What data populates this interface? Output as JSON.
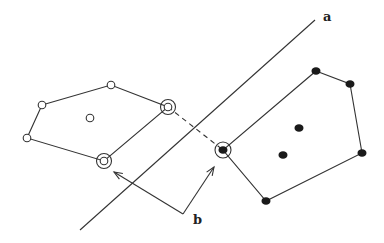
{
  "diagram": {
    "colors": {
      "line": "#333333",
      "filled_point": "#1a1a1a",
      "background": "#ffffff"
    },
    "separator": {
      "label": "a",
      "from": [
        80,
        230
      ],
      "to": [
        315,
        20
      ],
      "label_pos": [
        323,
        21
      ]
    },
    "class_open": {
      "hull": [
        [
          42,
          105
        ],
        [
          111,
          85
        ],
        [
          168,
          107
        ],
        [
          104,
          161
        ],
        [
          27,
          138
        ]
      ],
      "points": [
        {
          "x": 42,
          "y": 105,
          "support": false
        },
        {
          "x": 111,
          "y": 85,
          "support": false
        },
        {
          "x": 168,
          "y": 107,
          "support": true
        },
        {
          "x": 104,
          "y": 161,
          "support": true
        },
        {
          "x": 27,
          "y": 138,
          "support": false
        },
        {
          "x": 90,
          "y": 118,
          "support": false
        }
      ]
    },
    "class_filled": {
      "hull": [
        [
          316,
          71
        ],
        [
          350,
          84
        ],
        [
          362,
          153
        ],
        [
          266,
          201
        ],
        [
          223,
          150
        ]
      ],
      "points": [
        {
          "x": 316,
          "y": 71,
          "support": false
        },
        {
          "x": 350,
          "y": 84,
          "support": false
        },
        {
          "x": 362,
          "y": 153,
          "support": false
        },
        {
          "x": 266,
          "y": 201,
          "support": false
        },
        {
          "x": 223,
          "y": 150,
          "support": true
        },
        {
          "x": 299,
          "y": 128,
          "support": false
        },
        {
          "x": 283,
          "y": 155,
          "support": false
        }
      ]
    },
    "margin_lines": [
      {
        "from": [
          168,
          107
        ],
        "to": [
          198,
          80
        ],
        "note": "parallel edge through open support"
      },
      {
        "from": [
          104,
          161
        ],
        "to": [
          168,
          107
        ]
      },
      {
        "from": [
          223,
          150
        ],
        "to": [
          316,
          71
        ]
      }
    ],
    "closest_pair_dashed": {
      "from": [
        168,
        107
      ],
      "to": [
        223,
        150
      ]
    },
    "support_arrows": {
      "label": "b",
      "vertex": [
        183,
        214
      ],
      "targets": [
        [
          114,
          172
        ],
        [
          214,
          167
        ]
      ],
      "label_pos": [
        193,
        224
      ]
    }
  }
}
